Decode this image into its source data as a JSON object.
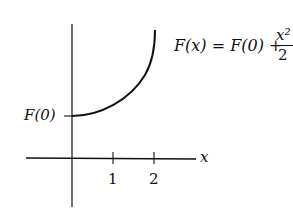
{
  "diagram": {
    "formula": {
      "lhs": "F(x)",
      "eq": "=",
      "rhs_const": "F(0)",
      "plus": "+",
      "numerator": "x²",
      "denominator": "2"
    },
    "y_intercept_label": "F(0)",
    "x_axis_label": "x",
    "ticks": [
      "1",
      "2"
    ],
    "colors": {
      "ink": "#111111",
      "background": "#ffffff"
    }
  }
}
